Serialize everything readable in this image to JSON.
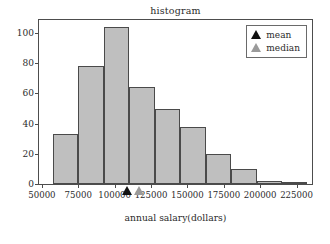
{
  "chart_data": {
    "type": "bar",
    "title": "histogram",
    "xlabel": "annual salary(dollars)",
    "ylabel": "",
    "grid": false,
    "xlim": [
      48000,
      237000
    ],
    "ylim": [
      0,
      110
    ],
    "bin_width": 17500,
    "bin_edges": [
      57500,
      75000,
      92500,
      110000,
      127500,
      145000,
      162500,
      180000,
      197500,
      215000,
      232500
    ],
    "categories": [
      "57500-75000",
      "75000-92500",
      "92500-110000",
      "110000-127500",
      "127500-145000",
      "145000-162500",
      "162500-180000",
      "180000-197500",
      "197500-215000",
      "215000-232500"
    ],
    "values": [
      33,
      78,
      104,
      64,
      50,
      38,
      20,
      10,
      2,
      1
    ],
    "bar_color": "#bfbfbf",
    "bar_edge_color": "#4a4a4a",
    "xticks": [
      50000,
      75000,
      100000,
      125000,
      150000,
      175000,
      200000,
      225000
    ],
    "xtick_labels": [
      "50000",
      "75000",
      "100000",
      "125000",
      "150000",
      "175000",
      "200000",
      "225000"
    ],
    "yticks": [
      0,
      20,
      40,
      60,
      80,
      100
    ],
    "ytick_labels": [
      "0",
      "20",
      "40",
      "60",
      "80",
      "100"
    ],
    "markers": [
      {
        "name": "mean",
        "label": "mean",
        "value": 109000,
        "color": "#111111"
      },
      {
        "name": "median",
        "label": "median",
        "value": 117500,
        "color": "#9a9a9a"
      }
    ],
    "legend": {
      "position": "upper right",
      "entries": [
        {
          "label": "mean",
          "color": "#111111",
          "marker": "triangle-up"
        },
        {
          "label": "median",
          "color": "#9a9a9a",
          "marker": "triangle-up"
        }
      ]
    }
  }
}
